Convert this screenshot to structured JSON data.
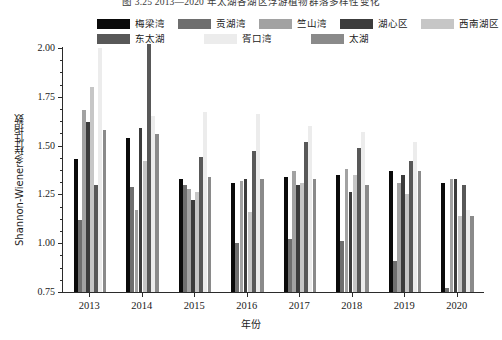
{
  "figure": {
    "caption": "图 3.25   2013—2020 年太湖各湖区浮游植物群落多样性变化"
  },
  "axis": {
    "y_title": "Shannon-Wiener多样性指数",
    "x_title": "年份",
    "y_ticks": [
      "0.75",
      "1.00",
      "1.25",
      "1.50",
      "1.75",
      "2.00"
    ],
    "y_min": 0.75,
    "y_max": 2.0,
    "y_minor_step": 0.0625
  },
  "colors": {
    "meiliang": "#0a0a0a",
    "gonghu": "#6e6e6e",
    "zhushan": "#a2a2a2",
    "huxin": "#3c3c3c",
    "xinanhu": "#c6c6c6",
    "dongtaihu": "#585858",
    "xukou": "#ececec",
    "taihu": "#8a8a8a",
    "axis": "#2b2b2b",
    "background": "#ffffff"
  },
  "chart_data": {
    "type": "bar",
    "title": "图 3.25   2013—2020 年太湖各湖区浮游植物群落多样性变化",
    "xlabel": "年份",
    "ylabel": "Shannon-Wiener多样性指数",
    "ylim": [
      0.75,
      2.0
    ],
    "grid": false,
    "legend_position": "top",
    "categories": [
      "2013",
      "2014",
      "2015",
      "2016",
      "2017",
      "2018",
      "2019",
      "2020"
    ],
    "series": [
      {
        "name": "梅梁湾",
        "color": "#0a0a0a",
        "values": [
          1.43,
          1.54,
          1.33,
          1.31,
          1.34,
          1.35,
          1.37,
          1.31
        ]
      },
      {
        "name": "贡湖湾",
        "color": "#6e6e6e",
        "values": [
          1.12,
          1.29,
          1.3,
          1.0,
          1.02,
          1.01,
          0.91,
          0.77
        ]
      },
      {
        "name": "竺山湾",
        "color": "#a2a2a2",
        "values": [
          1.68,
          1.17,
          1.28,
          1.32,
          1.37,
          1.38,
          1.31,
          1.33
        ]
      },
      {
        "name": "湖心区",
        "color": "#3c3c3c",
        "values": [
          1.62,
          1.59,
          1.22,
          1.33,
          1.3,
          1.26,
          1.35,
          1.33
        ]
      },
      {
        "name": "西南湖区",
        "color": "#c6c6c6",
        "values": [
          1.8,
          1.42,
          1.26,
          1.16,
          1.31,
          1.35,
          1.25,
          1.14
        ]
      },
      {
        "name": "东太湖",
        "color": "#585858",
        "values": [
          1.3,
          2.02,
          1.44,
          1.47,
          1.52,
          1.49,
          1.42,
          1.3
        ]
      },
      {
        "name": "胥口湾",
        "color": "#ececec",
        "values": [
          2.0,
          1.65,
          1.67,
          1.66,
          1.6,
          1.57,
          1.52,
          1.17
        ]
      },
      {
        "name": "太湖",
        "color": "#8a8a8a",
        "values": [
          1.58,
          1.56,
          1.34,
          1.33,
          1.33,
          1.3,
          1.37,
          1.14
        ]
      }
    ]
  },
  "legend": {
    "row1": [
      {
        "label": "梅梁湾",
        "color": "#0a0a0a"
      },
      {
        "label": "贡湖湾",
        "color": "#6e6e6e"
      },
      {
        "label": "竺山湾",
        "color": "#a2a2a2"
      },
      {
        "label": "湖心区",
        "color": "#3c3c3c"
      },
      {
        "label": "西南湖区",
        "color": "#c6c6c6"
      }
    ],
    "row2": [
      {
        "label": "东太湖",
        "color": "#585858"
      },
      {
        "label": "胥口湾",
        "color": "#ececec"
      },
      {
        "label": "太湖",
        "color": "#8a8a8a"
      }
    ]
  }
}
